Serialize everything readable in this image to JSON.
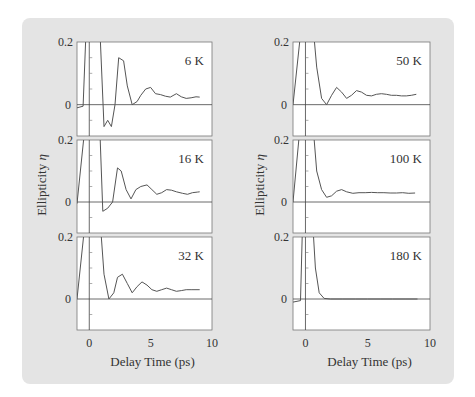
{
  "chart_data": [
    {
      "type": "line",
      "title": "6 K",
      "panel": "left-top",
      "xlabel": "Delay Time (ps)",
      "ylabel": "Ellipticity η",
      "xlim": [
        -1,
        10
      ],
      "ylim": [
        -0.1,
        0.2
      ],
      "x": [
        -1,
        -0.5,
        -0.2,
        0,
        0.3,
        0.8,
        1.2,
        1.5,
        1.8,
        2.1,
        2.4,
        2.8,
        3.1,
        3.5,
        3.9,
        4.2,
        4.6,
        5.0,
        5.4,
        5.8,
        6.2,
        6.6,
        7.1,
        7.5,
        7.9,
        8.3,
        8.7,
        9.0
      ],
      "y": [
        -0.01,
        -0.005,
        0.3,
        0.3,
        0.3,
        0.3,
        -0.07,
        -0.05,
        -0.07,
        0.0,
        0.15,
        0.14,
        0.06,
        0.0,
        0.01,
        0.03,
        0.05,
        0.055,
        0.035,
        0.032,
        0.027,
        0.024,
        0.035,
        0.025,
        0.02,
        0.022,
        0.025,
        0.024
      ]
    },
    {
      "type": "line",
      "title": "16 K",
      "panel": "left-middle",
      "xlabel": "Delay Time (ps)",
      "ylabel": "Ellipticity η",
      "xlim": [
        -1,
        10
      ],
      "ylim": [
        -0.1,
        0.2
      ],
      "x": [
        -1,
        -0.2,
        0,
        0.3,
        0.8,
        1.1,
        1.5,
        1.9,
        2.3,
        2.6,
        3.0,
        3.4,
        3.8,
        4.2,
        4.7,
        5.1,
        5.5,
        5.9,
        6.3,
        6.7,
        7.1,
        7.6,
        8.0,
        8.4,
        8.8,
        9.0
      ],
      "y": [
        -0.005,
        0.3,
        0.3,
        0.3,
        0.3,
        -0.03,
        -0.02,
        0.0,
        0.11,
        0.1,
        0.04,
        0.01,
        0.04,
        0.05,
        0.055,
        0.04,
        0.025,
        0.03,
        0.04,
        0.038,
        0.033,
        0.028,
        0.025,
        0.03,
        0.032,
        0.033
      ]
    },
    {
      "type": "line",
      "title": "32 K",
      "panel": "left-bottom",
      "xlabel": "Delay Time (ps)",
      "ylabel": "Ellipticity η",
      "xlim": [
        -1,
        10
      ],
      "ylim": [
        -0.1,
        0.2
      ],
      "x": [
        -1,
        -0.2,
        0,
        0.3,
        0.8,
        1.2,
        1.6,
        2.0,
        2.3,
        2.7,
        3.1,
        3.5,
        3.9,
        4.3,
        4.7,
        5.1,
        5.5,
        5.9,
        6.3,
        6.7,
        7.1,
        7.5,
        7.9,
        8.3,
        8.7,
        9.0
      ],
      "y": [
        0.0,
        0.3,
        0.3,
        0.3,
        0.3,
        0.08,
        0.0,
        0.02,
        0.07,
        0.08,
        0.05,
        0.02,
        0.04,
        0.055,
        0.045,
        0.03,
        0.025,
        0.03,
        0.035,
        0.03,
        0.025,
        0.027,
        0.03,
        0.03,
        0.03,
        0.03
      ]
    },
    {
      "type": "line",
      "title": "50 K",
      "panel": "right-top",
      "xlabel": "Delay Time (ps)",
      "ylabel": "Ellipticity η",
      "xlim": [
        -1,
        10
      ],
      "ylim": [
        -0.1,
        0.2
      ],
      "x": [
        -1,
        -0.2,
        0,
        0.5,
        0.9,
        1.3,
        1.7,
        2.1,
        2.5,
        2.9,
        3.3,
        3.7,
        4.1,
        4.5,
        4.9,
        5.3,
        5.7,
        6.1,
        6.5,
        6.9,
        7.3,
        7.7,
        8.1,
        8.5,
        8.9
      ],
      "y": [
        0.0,
        0.3,
        0.3,
        0.3,
        0.12,
        0.02,
        0.0,
        0.03,
        0.055,
        0.04,
        0.02,
        0.03,
        0.045,
        0.04,
        0.03,
        0.028,
        0.033,
        0.035,
        0.033,
        0.03,
        0.03,
        0.028,
        0.028,
        0.03,
        0.033
      ]
    },
    {
      "type": "line",
      "title": "100 K",
      "panel": "right-middle",
      "xlabel": "Delay Time (ps)",
      "ylabel": "Ellipticity η",
      "xlim": [
        -1,
        10
      ],
      "ylim": [
        -0.1,
        0.2
      ],
      "x": [
        -1,
        -0.3,
        0,
        0.5,
        0.9,
        1.3,
        1.7,
        2.1,
        2.5,
        2.9,
        3.3,
        3.8,
        4.3,
        4.8,
        5.3,
        5.8,
        6.3,
        6.8,
        7.3,
        7.8,
        8.3,
        8.8
      ],
      "y": [
        0.0,
        0.3,
        0.3,
        0.3,
        0.1,
        0.04,
        0.015,
        0.02,
        0.035,
        0.04,
        0.033,
        0.028,
        0.03,
        0.03,
        0.031,
        0.03,
        0.03,
        0.029,
        0.029,
        0.03,
        0.028,
        0.029
      ]
    },
    {
      "type": "line",
      "title": "180 K",
      "panel": "right-bottom",
      "xlabel": "Delay Time (ps)",
      "ylabel": "Ellipticity η",
      "xlim": [
        -1,
        10
      ],
      "ylim": [
        -0.1,
        0.2
      ],
      "x": [
        -1,
        -0.4,
        -0.2,
        0,
        0.5,
        0.8,
        1.1,
        1.5,
        2.0,
        3.0,
        4.0,
        5.0,
        6.0,
        7.0,
        8.0,
        9.0
      ],
      "y": [
        -0.01,
        -0.005,
        0.3,
        0.3,
        0.3,
        0.1,
        0.02,
        0.002,
        0.0,
        0.0,
        0.0,
        0.0,
        0.0,
        0.0,
        0.0,
        0.0
      ]
    }
  ],
  "axes": {
    "y_ticks": [
      "0.2",
      "0"
    ],
    "x_ticks": [
      "0",
      "5",
      "10"
    ],
    "xlabel": "Delay Time  (ps)",
    "ylabel": "Ellipticity",
    "ylabel_symbol": "η"
  },
  "labels": {
    "p0": "6 K",
    "p1": "16 K",
    "p2": "32 K",
    "p3": "50 K",
    "p4": "100 K",
    "p5": "180 K"
  },
  "colors": {
    "background": "#e4e4e4",
    "plot_bg": "#ffffff",
    "line": "#555555"
  }
}
